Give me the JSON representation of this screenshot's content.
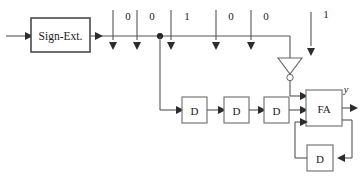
{
  "diagram": {
    "blocks": {
      "sign_ext": {
        "label": "Sign-Ext.",
        "name": "sign-extension-block"
      },
      "full_adder": {
        "label": "FA",
        "name": "full-adder-block"
      },
      "delay_1": {
        "label": "D"
      },
      "delay_2": {
        "label": "D"
      },
      "delay_3": {
        "label": "D"
      },
      "delay_carry": {
        "label": "D"
      }
    },
    "gate": {
      "inverter_label": "",
      "type": "inverter"
    },
    "bit_stream": {
      "values": [
        "0",
        "0",
        "1",
        "0",
        "0",
        "1"
      ],
      "x_positions": [
        128,
        162,
        196,
        250,
        286,
        340
      ]
    },
    "output": {
      "label": "y"
    },
    "colors": {
      "wire": "#555555",
      "block_stroke": "#777777",
      "block_stroke_strong": "#4a4a4a",
      "text": "#1a1a1a",
      "background": "#ffffff"
    }
  }
}
